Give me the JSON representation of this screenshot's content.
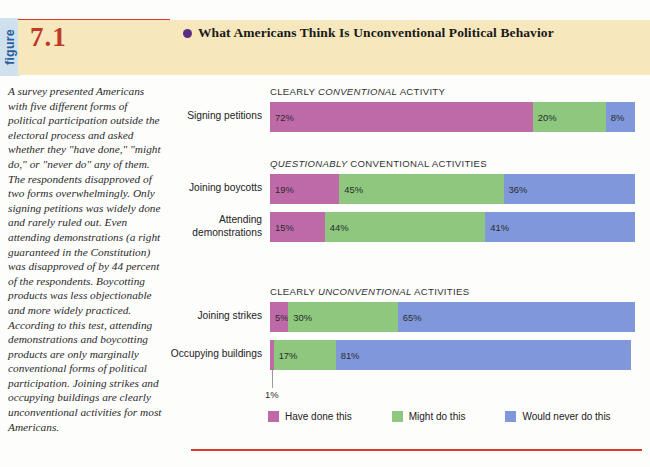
{
  "figure": {
    "tab_label": "figure",
    "number": "7.1",
    "title": "What Americans Think Is Unconventional Political Behavior",
    "caption": "A survey presented Americans with five different forms of political participation outside the electoral process and asked whether they \"have done,\" \"might do,\" or \"never do\" any of them. The respondents disapproved of two forms overwhelmingly. Only signing petitions was widely done and rarely ruled out. Even attending demonstrations (a right guaranteed in the Constitution) was disapproved of by 44 percent of the respondents. Boycotting products was less objectionable and more widely practiced. According to this test, attending demonstrations and boycotting products are only marginally conventional forms of political participation. Joining strikes and occupying buildings are clearly unconventional activities for most Americans."
  },
  "colors": {
    "have_done": "#bf6aa8",
    "might_do": "#8dc87e",
    "would_never": "#8098db",
    "rule_red": "#d93b2b",
    "band_beige": "#f6e7bd",
    "tab_blue": "#cfe0ef",
    "bullet_purple": "#5a2d82",
    "figure_number_red": "#c0392b"
  },
  "chart_data": {
    "type": "bar",
    "title": "What Americans Think Is Unconventional Political Behavior",
    "xlabel": "",
    "ylabel": "",
    "xlim": [
      0,
      100
    ],
    "grid": false,
    "stacked": true,
    "orientation": "horizontal",
    "legend_position": "bottom",
    "categories": [
      "Signing petitions",
      "Joining boycotts",
      "Attending demonstrations",
      "Joining strikes",
      "Occupying buildings"
    ],
    "series": [
      {
        "name": "Have done this",
        "color": "#bf6aa8",
        "values": [
          72,
          19,
          15,
          5,
          1
        ]
      },
      {
        "name": "Might do this",
        "color": "#8dc87e",
        "values": [
          20,
          45,
          44,
          30,
          17
        ]
      },
      {
        "name": "Would never do this",
        "color": "#8098db",
        "values": [
          8,
          36,
          41,
          65,
          81
        ]
      }
    ],
    "groups": [
      {
        "heading_plain_1": "CLEARLY ",
        "heading_italic": "CONVENTIONAL",
        "heading_plain_2": " ACTIVITY",
        "rows": [
          {
            "label": "Signing petitions",
            "label_line2": "",
            "segments": [
              {
                "series": "Have done this",
                "value": 72,
                "label": "72%",
                "show_label": true
              },
              {
                "series": "Might do this",
                "value": 20,
                "label": "20%",
                "show_label": true
              },
              {
                "series": "Would never do this",
                "value": 8,
                "label": "8%",
                "show_label": true
              }
            ]
          }
        ]
      },
      {
        "heading_plain_1": "",
        "heading_italic": "QUESTIONABLY",
        "heading_plain_2": " CONVENTIONAL ACTIVITIES",
        "rows": [
          {
            "label": "Joining boycotts",
            "label_line2": "",
            "segments": [
              {
                "series": "Have done this",
                "value": 19,
                "label": "19%",
                "show_label": true
              },
              {
                "series": "Might do this",
                "value": 45,
                "label": "45%",
                "show_label": true
              },
              {
                "series": "Would never do this",
                "value": 36,
                "label": "36%",
                "show_label": true
              }
            ]
          },
          {
            "label": "Attending",
            "label_line2": "demonstrations",
            "segments": [
              {
                "series": "Have done this",
                "value": 15,
                "label": "15%",
                "show_label": true
              },
              {
                "series": "Might do this",
                "value": 44,
                "label": "44%",
                "show_label": true
              },
              {
                "series": "Would never do this",
                "value": 41,
                "label": "41%",
                "show_label": true
              }
            ]
          }
        ]
      },
      {
        "heading_plain_1": "CLEARLY ",
        "heading_italic": "UNCONVENTIONAL",
        "heading_plain_2": " ACTIVITIES",
        "rows": [
          {
            "label": "Joining strikes",
            "label_line2": "",
            "segments": [
              {
                "series": "Have done this",
                "value": 5,
                "label": "5%",
                "show_label": true
              },
              {
                "series": "Might do this",
                "value": 30,
                "label": "30%",
                "show_label": true
              },
              {
                "series": "Would never do this",
                "value": 65,
                "label": "65%",
                "show_label": true
              }
            ]
          },
          {
            "label": "Occupying buildings",
            "label_line2": "",
            "segments": [
              {
                "series": "Have done this",
                "value": 1,
                "label": "1%",
                "show_label": false
              },
              {
                "series": "Might do this",
                "value": 17,
                "label": "17%",
                "show_label": true
              },
              {
                "series": "Would never do this",
                "value": 81,
                "label": "81%",
                "show_label": true
              }
            ]
          }
        ]
      }
    ],
    "callout": {
      "label": "1%",
      "refers_to": "Occupying buildings / Have done this"
    },
    "legend": [
      {
        "label": "Have done this",
        "color": "#bf6aa8"
      },
      {
        "label": "Might do this",
        "color": "#8dc87e"
      },
      {
        "label": "Would never do this",
        "color": "#8098db"
      }
    ]
  }
}
